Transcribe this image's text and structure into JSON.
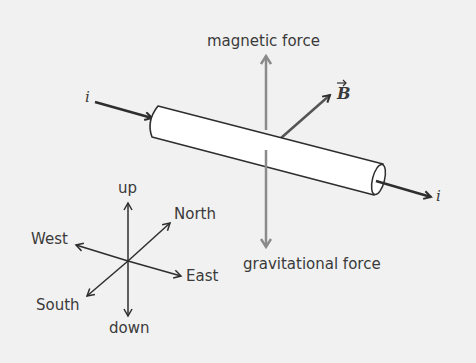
{
  "diagram": {
    "colors": {
      "background": "#f1f1f1",
      "ink": "#2e2e2e",
      "force_arrow": "#8a8a8a",
      "rod_fill": "#ffffff"
    },
    "labels": {
      "magnetic_force": "magnetic force",
      "gravitational_force": "gravitational force",
      "field": "B",
      "current_in": "i",
      "current_out": "i"
    },
    "compass": {
      "up": "up",
      "down": "down",
      "north": "North",
      "south": "South",
      "east": "East",
      "west": "West"
    }
  }
}
